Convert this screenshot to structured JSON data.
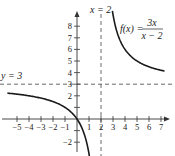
{
  "chart_data": {
    "type": "line",
    "title": "",
    "function_label": "f(x) = 3x / (x − 2)",
    "function_label_parts": {
      "lhs": "f(x) =",
      "num": "3x",
      "den": "x − 2"
    },
    "xlabel": "",
    "ylabel": "",
    "xlim": [
      -5.8,
      7.6
    ],
    "ylim": [
      -2.6,
      9.5
    ],
    "x_ticks": [
      -5,
      -4,
      -3,
      -2,
      -1,
      1,
      2,
      3,
      4,
      5,
      6,
      7
    ],
    "x_tick_labels": [
      "−5",
      "−4",
      "−3",
      "−2",
      "−1",
      "1",
      "2",
      "3",
      "4",
      "5",
      "6",
      "7"
    ],
    "y_ticks": [
      -2,
      -1,
      1,
      2,
      3,
      4,
      5,
      6,
      7,
      8
    ],
    "y_tick_labels": [
      "−2",
      "",
      "",
      "2",
      "3",
      "4",
      "5",
      "6",
      "7",
      "8"
    ],
    "grid": false,
    "asymptotes": [
      {
        "type": "vertical",
        "x": 2,
        "label": "x = 2",
        "style": "dashed"
      },
      {
        "type": "horizontal",
        "y": 3,
        "label": "y = 3",
        "style": "dashed"
      }
    ],
    "series": [
      {
        "name": "f(x) left branch",
        "x": [
          -5.8,
          -5,
          -4,
          -3,
          -2,
          -1,
          -0.5,
          0,
          0.5,
          1,
          1.15
        ],
        "y": [
          2.23,
          2.14,
          2.0,
          1.8,
          1.5,
          1.0,
          0.6,
          0,
          -1.0,
          -3.0,
          -4.06
        ]
      },
      {
        "name": "f(x) right branch",
        "x": [
          2.95,
          3,
          3.5,
          4,
          5,
          6,
          7,
          7.3
        ],
        "y": [
          9.3,
          9.0,
          7.0,
          6.0,
          5.0,
          4.5,
          4.2,
          4.13
        ]
      }
    ],
    "colors": {
      "curve": "#1a1a1a",
      "axis": "#333333",
      "asymptote": "#444444"
    }
  }
}
